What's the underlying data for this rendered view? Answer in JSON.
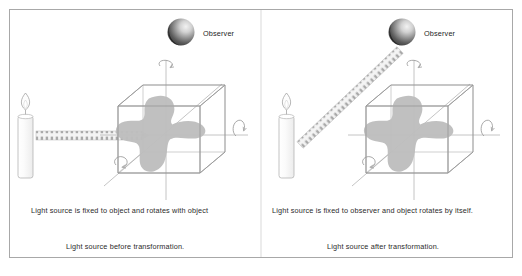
{
  "figure": {
    "background_color": "#ffffff",
    "frame_color": "#a8a8a8",
    "line_color": "#9a9a9a",
    "blob_color": "#bdbdbd",
    "sphere_dark": "#4a4a4a",
    "sphere_light": "#e9e9e9",
    "text_color": "#2b2b2b"
  },
  "panels": [
    {
      "id": "left",
      "observer_label": "Observer",
      "inner_caption": "Light source is fixed to object and rotates with object",
      "outer_caption": "Light source before transformation.",
      "light_direction": "horizontal",
      "icons": {
        "observer": "sphere-icon",
        "light_source": "candle-icon",
        "light_beam": "light-beam-icon",
        "object": "cube-with-blob-icon",
        "rotation_vertical": "rotation-arrow-icon",
        "rotation_horizontal": "rotation-arrow-icon",
        "rotation_diagonal": "rotation-arrow-icon"
      }
    },
    {
      "id": "right",
      "observer_label": "Observer",
      "inner_caption": "Light source is fixed to observer and object rotates by itself.",
      "outer_caption": "Light source after transformation.",
      "light_direction": "diagonal",
      "icons": {
        "observer": "sphere-icon",
        "light_source": "candle-icon",
        "light_beam": "light-beam-icon",
        "object": "cube-with-blob-icon",
        "rotation_vertical": "rotation-arrow-icon",
        "rotation_horizontal": "rotation-arrow-icon",
        "rotation_diagonal": "rotation-arrow-icon"
      }
    }
  ]
}
